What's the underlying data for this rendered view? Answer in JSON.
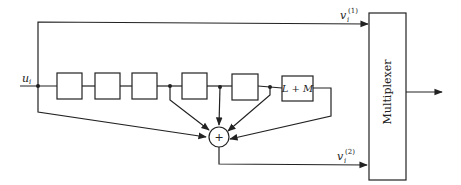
{
  "diagram": {
    "input": {
      "label": "u",
      "subscript": "i"
    },
    "outputs": [
      {
        "label": "v",
        "subscript": "i",
        "superscript": "(1)"
      },
      {
        "label": "v",
        "subscript": "i",
        "superscript": "(2)"
      }
    ],
    "delay_blocks": [
      "",
      "",
      "",
      "",
      ""
    ],
    "final_block": {
      "label": "L + M"
    },
    "adder": {
      "symbol": "+"
    },
    "multiplexer": {
      "label": "Multiplexer"
    }
  }
}
